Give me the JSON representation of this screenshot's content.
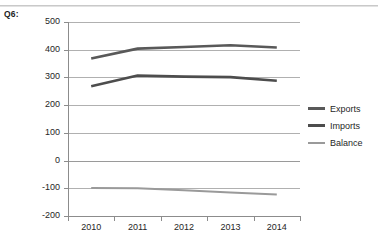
{
  "question_label": "Q6:",
  "chart_data": {
    "type": "line",
    "title": "",
    "xlabel": "",
    "ylabel": "",
    "categories": [
      "2010",
      "2011",
      "2012",
      "2013",
      "2014"
    ],
    "ylim": [
      -200,
      500
    ],
    "ytick_labels": [
      "500",
      "400",
      "300",
      "200",
      "100",
      "0",
      "-100",
      "-200"
    ],
    "ytick_values": [
      500,
      400,
      300,
      200,
      100,
      0,
      -100,
      -200
    ],
    "grid": true,
    "legend_position": "right",
    "series": [
      {
        "name": "Exports",
        "color": "#595959",
        "values": [
          368,
          404,
          410,
          416,
          408
        ]
      },
      {
        "name": "Imports",
        "color": "#4d4d4d",
        "values": [
          268,
          307,
          303,
          301,
          288
        ]
      },
      {
        "name": "Balance",
        "color": "#9a9a9a",
        "values": [
          -99,
          -100,
          -107,
          -115,
          -122
        ]
      }
    ]
  },
  "legend": {
    "items": [
      {
        "label": "Exports",
        "color": "#595959"
      },
      {
        "label": "Imports",
        "color": "#4d4d4d"
      },
      {
        "label": "Balance",
        "color": "#9a9a9a"
      }
    ]
  }
}
